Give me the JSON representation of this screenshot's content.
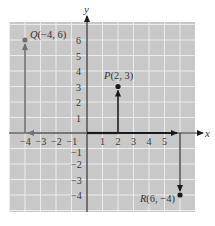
{
  "diagram": {
    "type": "coordinate-plane",
    "background_color": "#c8c8c8",
    "gridline_color": "#ececec",
    "axis_color": "#2a2a2a",
    "vector_color_dark": "#1a1a1a",
    "vector_color_gray": "#707070",
    "x_axis_label": "x",
    "y_axis_label": "y",
    "x_range": [
      -5,
      7
    ],
    "y_range": [
      -5,
      7
    ],
    "x_ticks": [
      {
        "value": -4,
        "label": "−4"
      },
      {
        "value": -3,
        "label": "−3"
      },
      {
        "value": -2,
        "label": "−2"
      },
      {
        "value": -1,
        "label": "−1"
      },
      {
        "value": 1,
        "label": "1"
      },
      {
        "value": 2,
        "label": "2"
      },
      {
        "value": 3,
        "label": "3"
      },
      {
        "value": 4,
        "label": "4"
      },
      {
        "value": 5,
        "label": "5"
      }
    ],
    "y_ticks": [
      {
        "value": 6,
        "label": "6"
      },
      {
        "value": 5,
        "label": "5"
      },
      {
        "value": 4,
        "label": "4"
      },
      {
        "value": 3,
        "label": "3"
      },
      {
        "value": 2,
        "label": "2"
      },
      {
        "value": 1,
        "label": "1"
      },
      {
        "value": -1,
        "label": "−1"
      },
      {
        "value": -2,
        "label": "−2"
      },
      {
        "value": -3,
        "label": "−3"
      },
      {
        "value": -4,
        "label": "−4"
      }
    ],
    "points": [
      {
        "name": "Q",
        "x": -4,
        "y": 6,
        "label": "Q(−4, 6)"
      },
      {
        "name": "P",
        "x": 2,
        "y": 3,
        "label": "P(2, 3)"
      },
      {
        "name": "R",
        "x": 6,
        "y": -4,
        "label": "R(6, −4)"
      }
    ]
  }
}
